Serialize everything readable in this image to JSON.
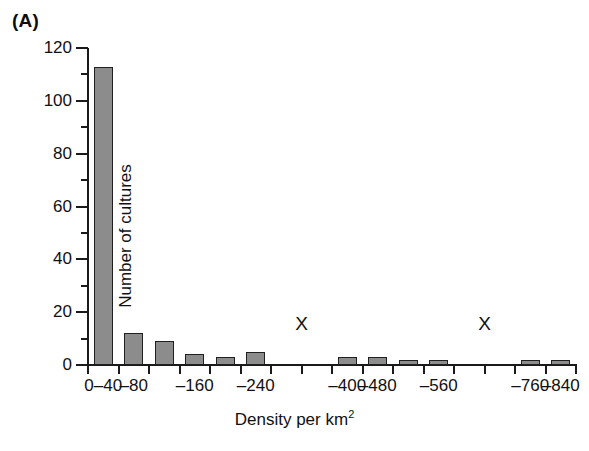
{
  "figure": {
    "panel_label": "(A)"
  },
  "chart_data": {
    "type": "bar",
    "title": "",
    "subtitle": "",
    "xlabel": "Density per km2",
    "xlabel_display": "Density per km",
    "xlabel_superscript": "2",
    "ylabel": "Number of cultures",
    "categories": [
      "0–40",
      "–80",
      "–120",
      "–160",
      "–200",
      "–240",
      "–280",
      "–320",
      "–400",
      "–480",
      "–520",
      "–560",
      "–640",
      "–720",
      "–760",
      "–840"
    ],
    "values": [
      113,
      12,
      9,
      4,
      3,
      5,
      0,
      0,
      3,
      3,
      2,
      2,
      0,
      0,
      2,
      2
    ],
    "xtick_labels": [
      "0–40",
      "–80",
      "–160",
      "–240",
      "–400",
      "–480",
      "–560",
      "–760",
      "–840"
    ],
    "xtick_label_indices": [
      0,
      1,
      3,
      5,
      8,
      9,
      11,
      14,
      15
    ],
    "ytick_labels": [
      "0",
      "20",
      "40",
      "60",
      "80",
      "100",
      "120"
    ],
    "ytick_values": [
      0,
      20,
      40,
      60,
      80,
      100,
      120
    ],
    "yminor_values": [
      10,
      30,
      50,
      70,
      90,
      110
    ],
    "ylim": [
      0,
      120
    ],
    "grid": false,
    "legend": false,
    "bar_fill_color": "#8c8c8c",
    "bar_edge_color": "#1f1f1f",
    "axis_color": "#1a1a1a",
    "annotations": [
      {
        "text": "X",
        "x_index": 6.5,
        "y": 12
      },
      {
        "text": "X",
        "x_index": 12.5,
        "y": 12
      }
    ]
  }
}
